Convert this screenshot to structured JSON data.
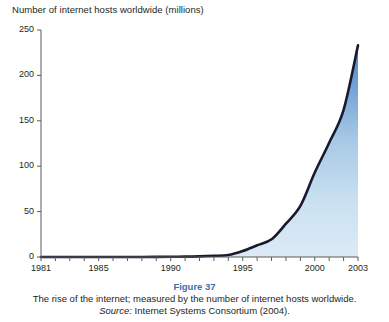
{
  "chart_data": {
    "type": "area",
    "title": "Number of internet hosts worldwide (millions)",
    "xlabel": "",
    "ylabel": "Number of internet hosts worldwide (millions)",
    "xlim": [
      1981,
      2003
    ],
    "ylim": [
      0,
      250
    ],
    "grid": false,
    "legend": "none",
    "line_color": "#1a1a2e",
    "fill_top_color": "#4a86c8",
    "fill_bottom_color": "#dceaf5",
    "y_ticks": [
      0,
      50,
      100,
      150,
      200,
      250
    ],
    "y_tick_labels": [
      "0",
      "50",
      "100",
      "150",
      "200",
      "250"
    ],
    "x_ticks": [
      1981,
      1982,
      1983,
      1984,
      1985,
      1986,
      1987,
      1988,
      1989,
      1990,
      1991,
      1992,
      1993,
      1994,
      1995,
      1996,
      1997,
      1998,
      1999,
      2000,
      2001,
      2002,
      2003
    ],
    "x_tick_labels_shown": [
      "1981",
      "1985",
      "1990",
      "1995",
      "2000",
      "2003"
    ],
    "x_tick_label_years": [
      1981,
      1985,
      1990,
      1995,
      2000,
      2003
    ],
    "fill_start_year": 1994,
    "x": [
      1981,
      1982,
      1983,
      1984,
      1985,
      1986,
      1987,
      1988,
      1989,
      1990,
      1991,
      1992,
      1993,
      1994,
      1995,
      1996,
      1997,
      1998,
      1999,
      2000,
      2001,
      2002,
      2003
    ],
    "values": [
      0.2,
      0.2,
      0.6,
      1,
      1.9,
      5,
      10,
      33,
      80,
      160,
      376,
      727,
      1313,
      2217,
      6642,
      12881,
      19540,
      36739,
      56218,
      93047,
      125888,
      162128,
      233101
    ],
    "values_millions": [
      0,
      0,
      0,
      0,
      0,
      0,
      0,
      0,
      0.1,
      0.2,
      0.4,
      0.7,
      1.3,
      2.2,
      6.6,
      12.9,
      19.5,
      36.7,
      56.2,
      93,
      125.9,
      162.1,
      233.1
    ],
    "peak_value": 233,
    "peak_year": 2003,
    "annotations": []
  },
  "caption": {
    "figure_number": "Figure 37",
    "description": "The rise of the internet; measured by the number of internet hosts worldwide.",
    "source_label": "Source:",
    "source_text": "Internet Systems Consortium (2004)."
  }
}
